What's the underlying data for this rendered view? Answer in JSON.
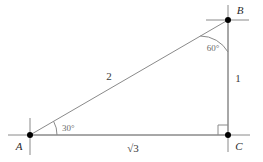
{
  "figure": {
    "type": "geometry-diagram",
    "background_color": "#ffffff",
    "line_color": "#8a8a8a",
    "vertex_color": "#000000",
    "label_color": "#3a3a3a"
  },
  "vertices": {
    "a": {
      "label": "A",
      "x": 30,
      "y": 135
    },
    "b": {
      "label": "B",
      "x": 228,
      "y": 20
    },
    "c": {
      "label": "C",
      "x": 228,
      "y": 135
    }
  },
  "sides": {
    "hypotenuse": {
      "label": "2",
      "from": "A",
      "to": "B"
    },
    "vertical": {
      "label": "1",
      "from": "B",
      "to": "C"
    },
    "base": {
      "label": "√3",
      "from": "A",
      "to": "C"
    }
  },
  "angles": {
    "at_a": {
      "label": "30°",
      "value": 30
    },
    "at_b": {
      "label": "60°",
      "value": 60
    },
    "at_c": {
      "label": "",
      "value": 90,
      "marker": "right-angle-square"
    }
  }
}
